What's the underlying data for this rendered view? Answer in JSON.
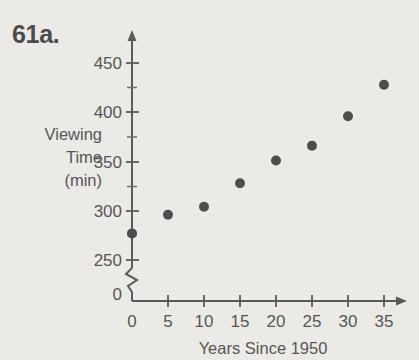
{
  "problem": {
    "number": "61a."
  },
  "chart_data": {
    "type": "scatter",
    "title": "",
    "xlabel": "Years Since 1950",
    "ylabel_lines": [
      "Viewing",
      "Time",
      "(min)"
    ],
    "ylabel": "Viewing Time (min)",
    "x": [
      0,
      5,
      10,
      15,
      20,
      25,
      30,
      35
    ],
    "values": [
      277,
      296,
      304,
      328,
      351,
      366,
      396,
      428
    ],
    "points": [
      {
        "x": 0,
        "y": 277
      },
      {
        "x": 5,
        "y": 296
      },
      {
        "x": 10,
        "y": 304
      },
      {
        "x": 15,
        "y": 328
      },
      {
        "x": 20,
        "y": 351
      },
      {
        "x": 25,
        "y": 366
      },
      {
        "x": 30,
        "y": 396
      },
      {
        "x": 35,
        "y": 428
      }
    ],
    "xticks": [
      0,
      5,
      10,
      15,
      20,
      25,
      30,
      35
    ],
    "xtick_labels": [
      "0",
      "5",
      "10",
      "15",
      "20",
      "25",
      "30",
      "35"
    ],
    "yticks": [
      250,
      300,
      350,
      400,
      450
    ],
    "ytick_labels": [
      "250",
      "300",
      "350",
      "400",
      "450"
    ],
    "ytick_minor": [
      275,
      325,
      375,
      425
    ],
    "y_origin_label": "0",
    "axis_break": true,
    "xlim": [
      0,
      37
    ],
    "ylim": [
      250,
      462
    ],
    "grid": false,
    "legend": null,
    "marker_color": "#4d4d4d",
    "axis_color": "#5a5a5a",
    "background_color": "#eceae6"
  }
}
